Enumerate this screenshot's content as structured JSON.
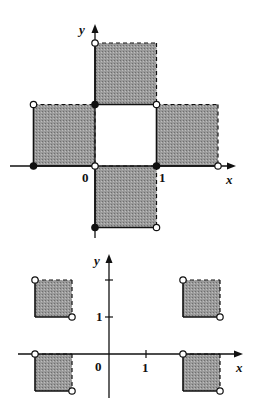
{
  "colors": {
    "fill": "#8f8f8f",
    "line": "#111111",
    "background": "#ffffff"
  },
  "top_figure": {
    "x_label": "x",
    "y_label": "y",
    "tick_labels": {
      "origin": "0",
      "x1": "1"
    },
    "squares": [
      {
        "id": "up",
        "x": [
          0,
          1
        ],
        "y": [
          1,
          2
        ],
        "solid_edges": [
          "left",
          "bottom"
        ],
        "dashed_edges": [
          "top",
          "right"
        ]
      },
      {
        "id": "left",
        "x": [
          -1,
          0
        ],
        "y": [
          0,
          1
        ],
        "solid_edges": [
          "left",
          "bottom"
        ],
        "dashed_edges": [
          "top",
          "right"
        ]
      },
      {
        "id": "right",
        "x": [
          1,
          2
        ],
        "y": [
          0,
          1
        ],
        "solid_edges": [
          "left",
          "bottom"
        ],
        "dashed_edges": [
          "top",
          "right"
        ]
      },
      {
        "id": "down",
        "x": [
          0,
          1
        ],
        "y": [
          -1,
          0
        ],
        "solid_edges": [
          "left",
          "bottom"
        ],
        "dashed_edges": [
          "top",
          "right"
        ]
      }
    ],
    "points": [
      {
        "x": 0,
        "y": 2,
        "type": "open"
      },
      {
        "x": 0,
        "y": 1,
        "type": "closed"
      },
      {
        "x": 1,
        "y": 1,
        "type": "open"
      },
      {
        "x": -1,
        "y": 1,
        "type": "open"
      },
      {
        "x": -1,
        "y": 0,
        "type": "closed"
      },
      {
        "x": 0,
        "y": 0,
        "type": "open"
      },
      {
        "x": 1,
        "y": 0,
        "type": "closed"
      },
      {
        "x": 2,
        "y": 0,
        "type": "open"
      },
      {
        "x": 0,
        "y": -1,
        "type": "closed"
      },
      {
        "x": 1,
        "y": -1,
        "type": "open"
      }
    ]
  },
  "bottom_figure": {
    "x_label": "x",
    "y_label": "y",
    "tick_labels": {
      "origin": "0",
      "x1": "1",
      "y1": "1"
    },
    "squares": [
      {
        "id": "top-left",
        "x": [
          -2,
          -1
        ],
        "y": [
          1,
          2
        ]
      },
      {
        "id": "top-right",
        "x": [
          2,
          3
        ],
        "y": [
          1,
          2
        ]
      },
      {
        "id": "bottom-left",
        "x": [
          -2,
          -1
        ],
        "y": [
          -1,
          0
        ]
      },
      {
        "id": "bottom-right",
        "x": [
          2,
          3
        ],
        "y": [
          -1,
          0
        ]
      }
    ],
    "points_note": "open circles at top-left and bottom-right corner of each square"
  }
}
